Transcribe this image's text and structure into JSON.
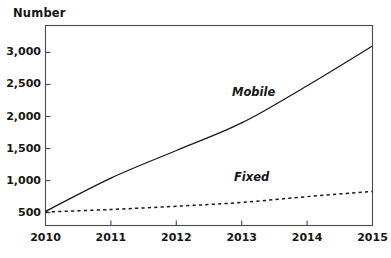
{
  "chart_data": {
    "type": "line",
    "title": "",
    "ylabel": "Number",
    "xlabel": "",
    "x": [
      2010,
      2011,
      2012,
      2013,
      2014,
      2015
    ],
    "xticklabels": [
      "2010",
      "2011",
      "2012",
      "2013",
      "2014",
      "2015"
    ],
    "yticks": [
      500,
      1000,
      1500,
      2000,
      2500,
      3000
    ],
    "yticklabels": [
      "500",
      "1,000",
      "1,500",
      "2,000",
      "2,500",
      "3,000"
    ],
    "ylim": [
      300,
      3420
    ],
    "xlim": [
      2010,
      2015
    ],
    "grid": false,
    "legend_position": "inline-annotation",
    "series": [
      {
        "name": "Mobile",
        "style": "solid",
        "color": "#1a1a1a",
        "values": [
          520,
          1040,
          1470,
          1900,
          2480,
          3100
        ],
        "annotation": "Mobile"
      },
      {
        "name": "Fixed",
        "style": "dashed",
        "color": "#1a1a1a",
        "values": [
          510,
          550,
          600,
          660,
          750,
          830
        ],
        "annotation": "Fixed"
      }
    ],
    "annotations": [
      {
        "text": "Mobile",
        "x_px": 232,
        "y_px": 87
      },
      {
        "text": "Fixed",
        "x_px": 234,
        "y_px": 172
      }
    ],
    "axis_color": "#4a4a4a",
    "text_color": "#161616",
    "background": "#ffffff"
  }
}
